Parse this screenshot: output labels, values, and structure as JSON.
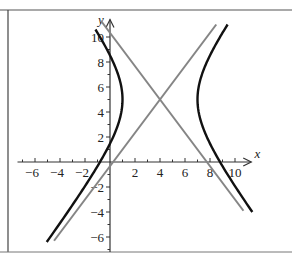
{
  "chart_data": {
    "type": "line",
    "title": "",
    "xlabel": "x",
    "ylabel": "y",
    "xlim": [
      -7,
      11
    ],
    "ylim": [
      -7,
      11
    ],
    "grid": false,
    "x_ticks": [
      -6,
      -4,
      -2,
      2,
      4,
      6,
      8,
      10
    ],
    "y_ticks": [
      -6,
      -4,
      -2,
      2,
      4,
      6,
      8,
      10
    ],
    "x_tick_labels": [
      "−6",
      "−4",
      "−2",
      "2",
      "4",
      "6",
      "8",
      "10"
    ],
    "y_tick_labels": [
      "−6",
      "−4",
      "−2",
      "2",
      "4",
      "6",
      "8",
      "10"
    ],
    "series": [
      {
        "name": "hyperbola",
        "equation": "(x-4)^2/9 - (y-5)^2/16 = 1",
        "center": [
          4,
          5
        ],
        "a": 3,
        "b": 4,
        "color": "#111111"
      },
      {
        "name": "asymptote-rising",
        "equation": "y - 5 = (4/3)(x - 4)",
        "color": "#808080"
      },
      {
        "name": "asymptote-falling",
        "equation": "y - 5 = -(4/3)(x - 4)",
        "color": "#808080"
      }
    ]
  },
  "colors": {
    "hyperbola": "#111111",
    "asymptote": "#858585",
    "axis": "#333333",
    "frame": "#444444"
  }
}
